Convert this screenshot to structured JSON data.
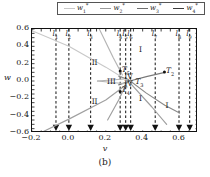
{
  "caption": "(b)",
  "axes": {
    "xlabel": "v",
    "ylabel": "w",
    "xlim": [
      -0.2,
      0.7
    ],
    "ylim": [
      -0.6,
      0.6
    ],
    "xticks": [
      -0.2,
      0.0,
      0.2,
      0.4,
      0.6
    ],
    "xticklabels": [
      "−0.2",
      "0.0",
      "0.2",
      "0.4",
      "0.6"
    ],
    "yticks": [
      0.6,
      0.4,
      0.2,
      0.0,
      -0.2,
      -0.4,
      -0.6
    ],
    "yticklabels": [
      "0.6",
      "0.4",
      "0.2",
      "0.0",
      "−0.2",
      "−0.4",
      "−0.6"
    ]
  },
  "legend": {
    "position": "above-axes",
    "entries": [
      {
        "label": "w",
        "sub": "1",
        "sup": "*",
        "color": "#c8c8c8"
      },
      {
        "label": "w",
        "sub": "2",
        "sup": "*",
        "color": "#9a9a9a"
      },
      {
        "label": "w",
        "sub": "3",
        "sup": "*",
        "color": "#6e6e6e"
      },
      {
        "label": "w",
        "sub": "4",
        "sup": "*",
        "color": "#3c3c3c"
      }
    ]
  },
  "chart_data": {
    "type": "line",
    "title": "",
    "xlabel": "v",
    "ylabel": "w",
    "xlim": [
      -0.2,
      0.7
    ],
    "ylim": [
      -0.6,
      0.6
    ],
    "grid": false,
    "series": [
      {
        "name": "w1*",
        "color": "#c8c8c8",
        "points": [
          [
            -0.2,
            0.58
          ],
          [
            0.0,
            0.4
          ],
          [
            0.2,
            0.16
          ],
          [
            0.3,
            0.03
          ],
          [
            0.325,
            0.0
          ]
        ]
      },
      {
        "name": "w2*",
        "color": "#a0a0a0",
        "points": [
          [
            -0.155,
            -0.6
          ],
          [
            0.0,
            -0.44
          ],
          [
            0.2,
            -0.22
          ],
          [
            0.3,
            -0.06
          ],
          [
            0.325,
            0.0
          ]
        ]
      },
      {
        "name": "w3*",
        "color": "#8a8a8a",
        "points": [
          [
            0.27,
            0.055
          ],
          [
            0.32,
            0.02
          ],
          [
            0.42,
            -0.14
          ],
          [
            0.52,
            -0.28
          ],
          [
            0.6,
            -0.37
          ]
        ]
      },
      {
        "name": "w4*",
        "color": "#7a7a7a",
        "points": [
          [
            0.27,
            -0.045
          ],
          [
            0.33,
            0.0
          ],
          [
            0.42,
            0.05
          ],
          [
            0.52,
            0.1
          ]
        ]
      },
      {
        "name": "w-branch-left-upper",
        "color": "#b4b4b4",
        "points": [
          [
            0.165,
            0.6
          ],
          [
            0.24,
            0.27
          ],
          [
            0.29,
            0.07
          ]
        ]
      },
      {
        "name": "w-branch-left-lower",
        "color": "#b4b4b4",
        "points": [
          [
            0.155,
            0.0
          ],
          [
            0.25,
            -0.02
          ],
          [
            0.3,
            -0.03
          ]
        ]
      },
      {
        "name": "w-branch-upper-flat",
        "color": "#b4b4b4",
        "points": [
          [
            0.155,
            0.0
          ],
          [
            0.25,
            0.015
          ],
          [
            0.3,
            0.025
          ]
        ]
      },
      {
        "name": "w-branch-from-bottom",
        "color": "#9e9e9e",
        "points": [
          [
            0.21,
            -0.45
          ],
          [
            0.27,
            -0.22
          ],
          [
            0.305,
            -0.06
          ]
        ]
      },
      {
        "name": "w-branch-right-down",
        "color": "#9e9e9e",
        "points": [
          [
            0.335,
            -0.03
          ],
          [
            0.45,
            -0.3
          ],
          [
            0.53,
            -0.5
          ]
        ]
      }
    ],
    "vertical_lines": [
      {
        "name": "l1",
        "label": "l",
        "sub": "1",
        "v": -0.07
      },
      {
        "name": "l2",
        "label": "l",
        "sub": "2",
        "v": 0.0
      },
      {
        "name": "l3",
        "label": "l",
        "sub": "3",
        "v": 0.118
      },
      {
        "name": "l4",
        "label": "l",
        "sub": "4",
        "v": 0.278
      },
      {
        "name": "l5",
        "label": "l",
        "sub": "5",
        "v": 0.308
      },
      {
        "name": "l6",
        "label": "l",
        "sub": "6",
        "v": 0.335
      },
      {
        "name": "l7",
        "label": "l",
        "sub": "7",
        "v": 0.468
      },
      {
        "name": "l8",
        "label": "l",
        "sub": "8",
        "v": 0.597
      },
      {
        "name": "l9",
        "label": "l",
        "sub": "9",
        "v": 0.655
      }
    ],
    "arrow_markers": {
      "style": "down-triangle-at-bottom",
      "v": [
        -0.07,
        0.0,
        0.118,
        0.278,
        0.308,
        0.335,
        0.468,
        0.597,
        0.655
      ]
    },
    "region_labels": [
      {
        "text": "II",
        "v": 0.145,
        "w": 0.2
      },
      {
        "text": "II",
        "v": 0.145,
        "w": -0.25
      },
      {
        "text": "III",
        "v": 0.228,
        "w": -0.02
      },
      {
        "text": "IV",
        "v": 0.322,
        "w": 0.04
      },
      {
        "text": "IV",
        "v": 0.322,
        "w": -0.05
      },
      {
        "text": "I",
        "v": 0.402,
        "w": 0.35
      },
      {
        "text": "I",
        "v": 0.402,
        "w": -0.22
      },
      {
        "text": "I",
        "v": 0.545,
        "w": -0.3
      }
    ],
    "point_annotations": [
      {
        "label": "T",
        "sub": "2",
        "v": 0.518,
        "w": 0.103,
        "marker": true
      },
      {
        "label": "T",
        "sub": "3",
        "v": 0.352,
        "w": -0.02,
        "marker": false
      },
      {
        "label": "T",
        "sub": "4",
        "v": 0.278,
        "w": -0.12,
        "marker": true
      },
      {
        "label": "T",
        "sub": "5",
        "v": 0.278,
        "w": 0.115,
        "marker": true
      }
    ]
  }
}
